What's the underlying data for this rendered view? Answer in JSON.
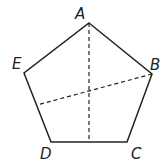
{
  "figure": {
    "stroke_color": "#222222",
    "vertices": [
      {
        "label": "A",
        "x": 89,
        "y": 23,
        "lx": 75,
        "ly": 19
      },
      {
        "label": "B",
        "x": 152,
        "y": 74,
        "lx": 150,
        "ly": 70
      },
      {
        "label": "C",
        "x": 127,
        "y": 142,
        "lx": 131,
        "ly": 159
      },
      {
        "label": "D",
        "x": 51,
        "y": 142,
        "lx": 40,
        "ly": 159
      },
      {
        "label": "E",
        "x": 24,
        "y": 73,
        "lx": 12,
        "ly": 69
      }
    ],
    "dashed_segments": [
      {
        "from": "A",
        "to": "midpoint of DC",
        "x1": 89,
        "y1": 23,
        "x2": 89,
        "y2": 142
      },
      {
        "from": "B",
        "to": "point on ED",
        "x1": 152,
        "y1": 74,
        "x2": 37,
        "y2": 105
      }
    ]
  }
}
